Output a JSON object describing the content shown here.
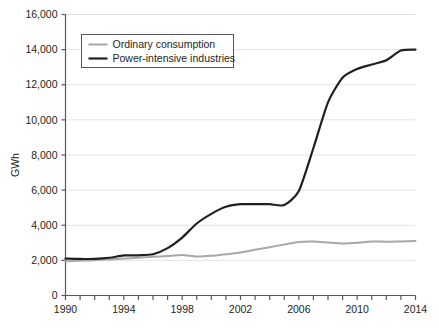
{
  "chart_data": {
    "type": "line",
    "title": "",
    "xlabel": "",
    "ylabel": "GWh",
    "xlim": [
      1990,
      2014
    ],
    "ylim": [
      0,
      16000
    ],
    "grid": true,
    "legend_position": "top-left",
    "y_ticks": [
      0,
      2000,
      4000,
      6000,
      8000,
      10000,
      12000,
      14000,
      16000
    ],
    "y_tick_labels": [
      "0",
      "2,000",
      "4,000",
      "6,000",
      "8,000",
      "10,000",
      "12,000",
      "14,000",
      "16,000"
    ],
    "x_ticks": [
      1990,
      1991,
      1992,
      1993,
      1994,
      1995,
      1996,
      1997,
      1998,
      1999,
      2000,
      2001,
      2002,
      2003,
      2004,
      2005,
      2006,
      2007,
      2008,
      2009,
      2010,
      2011,
      2012,
      2013,
      2014
    ],
    "x_tick_labels": [
      "1990",
      "",
      "",
      "",
      "1994",
      "",
      "",
      "",
      "1998",
      "",
      "",
      "",
      "2002",
      "",
      "",
      "",
      "2006",
      "",
      "",
      "",
      "2010",
      "",
      "",
      "",
      "2014"
    ],
    "x": [
      1990,
      1991,
      1992,
      1993,
      1994,
      1995,
      1996,
      1997,
      1998,
      1999,
      2000,
      2001,
      2002,
      2003,
      2004,
      2005,
      2006,
      2007,
      2008,
      2009,
      2010,
      2011,
      2012,
      2013,
      2014
    ],
    "series": [
      {
        "name": "Ordinary consumption",
        "color": "#a8a8a8",
        "width": 2.0,
        "values": [
          1950,
          1980,
          2010,
          2050,
          2100,
          2150,
          2200,
          2250,
          2300,
          2220,
          2260,
          2350,
          2450,
          2600,
          2750,
          2900,
          3050,
          3080,
          3020,
          2960,
          3000,
          3080,
          3060,
          3080,
          3100
        ]
      },
      {
        "name": "Power-intensive industries",
        "color": "#231f20",
        "width": 2.2,
        "values": [
          2100,
          2080,
          2090,
          2150,
          2280,
          2290,
          2350,
          2700,
          3300,
          4100,
          4650,
          5050,
          5200,
          5200,
          5200,
          5150,
          5950,
          8400,
          11000,
          12400,
          12900,
          13150,
          13400,
          13950,
          14000
        ]
      }
    ]
  },
  "legend": {
    "items": [
      {
        "label": "Ordinary consumption"
      },
      {
        "label": "Power-intensive industries"
      }
    ]
  }
}
